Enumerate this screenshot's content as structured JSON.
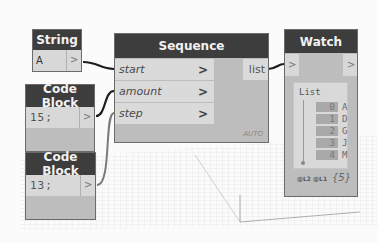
{
  "nodes": {
    "string": {
      "title": "String",
      "value": "A",
      "output_chevron": ">"
    },
    "code_block_1": {
      "title": "Code Block",
      "value": "15;",
      "output_chevron": ">"
    },
    "code_block_2": {
      "title": "Code Block",
      "value": "13;",
      "output_chevron": ">"
    },
    "sequence": {
      "title": "Sequence",
      "inputs": [
        {
          "label": "start",
          "chevron": ">"
        },
        {
          "label": "amount",
          "chevron": ">"
        },
        {
          "label": "step",
          "chevron": ">"
        }
      ],
      "output": "list",
      "lacing": "AUTO"
    },
    "watch": {
      "title": "Watch",
      "input_chevron": ">",
      "output_chevron": ">",
      "list_header": "List",
      "items": [
        {
          "index": "0",
          "value": "A"
        },
        {
          "index": "1",
          "value": "D"
        },
        {
          "index": "2",
          "value": "G"
        },
        {
          "index": "3",
          "value": "J"
        },
        {
          "index": "4",
          "value": "M"
        }
      ],
      "levels": "@L2 @L1",
      "count": "{5}"
    }
  },
  "colors": {
    "header": "#3d3d3d",
    "node_body": "#bdbdbd",
    "port_row": "#dadada",
    "wire": "#1e1e1e",
    "wire_light": "#7a7a7a"
  }
}
